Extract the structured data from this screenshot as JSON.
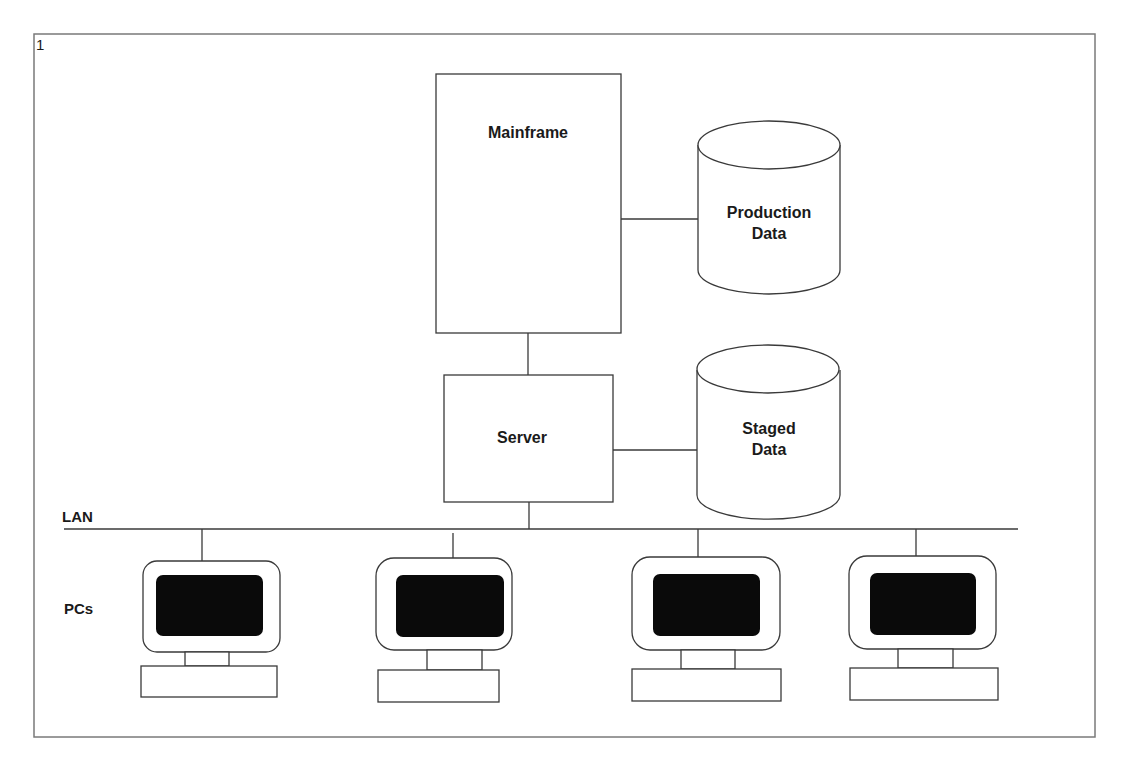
{
  "figure": {
    "number": "1"
  },
  "nodes": {
    "mainframe": {
      "label": "Mainframe"
    },
    "production_data": {
      "line1": "Production",
      "line2": "Data"
    },
    "server": {
      "label": "Server"
    },
    "staged_data": {
      "line1": "Staged",
      "line2": "Data"
    }
  },
  "network": {
    "lan_label": "LAN",
    "pcs_label": "PCs",
    "pc_count": 4
  },
  "colors": {
    "line": "#3a3a3a",
    "frame": "#7a7a7a",
    "screen": "#0a0a0a",
    "background": "#ffffff"
  }
}
